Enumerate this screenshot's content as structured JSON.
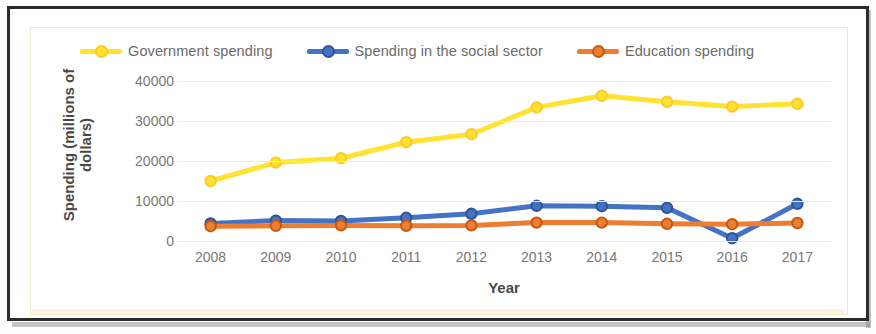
{
  "chart_data": {
    "type": "line",
    "title": "",
    "xlabel": "Year",
    "ylabel": "Spending (millions of dollars)",
    "ylabel_line1": "Spending (millions of",
    "ylabel_line2": "dollars)",
    "categories": [
      "2008",
      "2009",
      "2010",
      "2011",
      "2012",
      "2013",
      "2014",
      "2015",
      "2016",
      "2017"
    ],
    "ytick_labels": [
      "40000",
      "30000",
      "20000",
      "10000",
      "0"
    ],
    "yticks": [
      40000,
      30000,
      20000,
      10000,
      0
    ],
    "ylim": [
      0,
      40000
    ],
    "grid": true,
    "legend_position": "top",
    "series": [
      {
        "name": "Government spending",
        "color": "#FFE232",
        "marker_color": "#FFC926",
        "values": [
          15000,
          19600,
          20700,
          24700,
          26700,
          33400,
          36300,
          34800,
          33600,
          34300
        ]
      },
      {
        "name": "Spending in the social sector",
        "color": "#4472C4",
        "marker_color": "#2F5597",
        "values": [
          4400,
          5100,
          5000,
          5800,
          6800,
          8800,
          8700,
          8300,
          700,
          9300
        ]
      },
      {
        "name": "Education spending",
        "color": "#ED7D31",
        "marker_color": "#C55A11",
        "values": [
          3700,
          3800,
          3900,
          3800,
          3900,
          4600,
          4600,
          4300,
          4200,
          4500
        ]
      }
    ]
  }
}
